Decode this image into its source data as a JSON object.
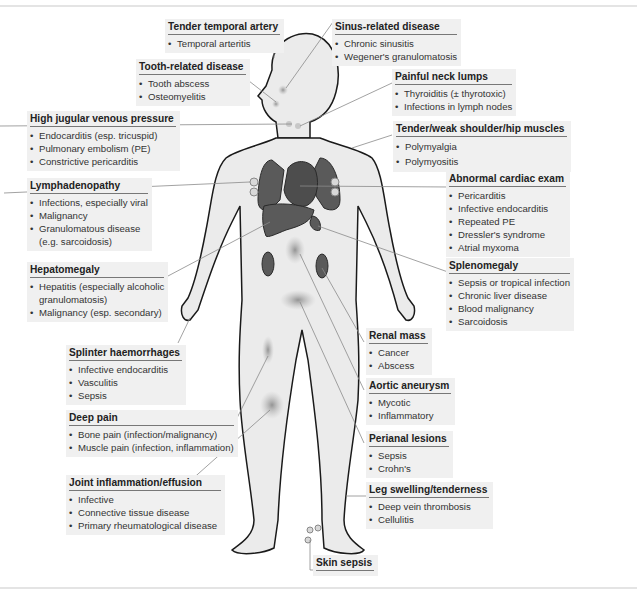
{
  "figure": {
    "colors": {
      "box_bg": "#f0f0f0",
      "body_fill": "#ebebeb",
      "organ_fill": "#5a5a5a",
      "outline": "#1a1a1a",
      "leader": "#888888"
    },
    "labels": {
      "temporal": {
        "title": "Tender temporal artery",
        "items": [
          "Temporal arteritis"
        ]
      },
      "sinus": {
        "title": "Sinus-related disease",
        "items": [
          "Chronic sinusitis",
          "Wegener's granulomatosis"
        ]
      },
      "tooth": {
        "title": "Tooth-related disease",
        "items": [
          "Tooth abscess",
          "Osteomyelitis"
        ]
      },
      "neck": {
        "title": "Painful neck lumps",
        "items": [
          "Thyroiditis (± thyrotoxic)",
          "Infections in lymph nodes"
        ]
      },
      "jvp": {
        "title": "High jugular venous pressure",
        "items": [
          "Endocarditis (esp. tricuspid)",
          "Pulmonary embolism (PE)",
          "Constrictive pericarditis"
        ]
      },
      "shoulder": {
        "title": "Tender/weak shoulder/hip muscles",
        "items": [
          "Polymyalgia",
          "Polymyositis"
        ]
      },
      "lymph": {
        "title": "Lymphadenopathy",
        "items": [
          "Infections, especially viral",
          "Malignancy",
          "Granulomatous disease",
          "(e.g. sarcoidosis)"
        ]
      },
      "cardiac": {
        "title": "Abnormal cardiac exam",
        "items": [
          "Pericarditis",
          "Infective endocarditis",
          "Repeated PE",
          "Dressler's syndrome",
          "Atrial myxoma"
        ]
      },
      "hepato": {
        "title": "Hepatomegaly",
        "items": [
          "Hepatitis (especially alcoholic",
          "granulomatosis)",
          "Malignancy (esp. secondary)"
        ]
      },
      "spleno": {
        "title": "Splenomegaly",
        "items": [
          "Sepsis or tropical infection",
          "Chronic liver disease",
          "Blood malignancy",
          "Sarcoidosis"
        ]
      },
      "splinter": {
        "title": "Splinter haemorrhages",
        "items": [
          "Infective endocarditis",
          "Vasculitis",
          "Sepsis"
        ]
      },
      "renal": {
        "title": "Renal mass",
        "items": [
          "Cancer",
          "Abscess"
        ]
      },
      "aortic": {
        "title": "Aortic aneurysm",
        "items": [
          "Mycotic",
          "Inflammatory"
        ]
      },
      "deep": {
        "title": "Deep pain",
        "items": [
          "Bone pain (infection/malignancy)",
          "Muscle pain (infection, inflammation)"
        ]
      },
      "perianal": {
        "title": "Perianal lesions",
        "items": [
          "Sepsis",
          "Crohn's"
        ]
      },
      "joint": {
        "title": "Joint inflammation/effusion",
        "items": [
          "Infective",
          "Connective tissue disease",
          "Primary rheumatological disease"
        ]
      },
      "leg": {
        "title": "Leg swelling/tenderness",
        "items": [
          "Deep vein thrombosis",
          "Cellulitis"
        ]
      },
      "skin": {
        "title": "Skin sepsis",
        "items": []
      }
    }
  }
}
